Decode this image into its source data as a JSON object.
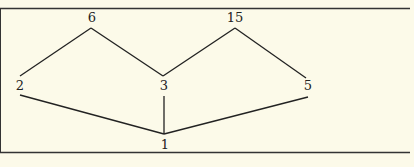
{
  "diagram": {
    "type": "hasse-diagram",
    "nodes": [
      {
        "id": "n6",
        "label": "6",
        "x": 91,
        "y": 21
      },
      {
        "id": "n15",
        "label": "15",
        "x": 235,
        "y": 21
      },
      {
        "id": "n2",
        "label": "2",
        "x": 20,
        "y": 88
      },
      {
        "id": "n3",
        "label": "3",
        "x": 164,
        "y": 88
      },
      {
        "id": "n5",
        "label": "5",
        "x": 307,
        "y": 88
      },
      {
        "id": "n1",
        "label": "1",
        "x": 165,
        "y": 153
      }
    ],
    "edges": [
      {
        "from": "2",
        "to": "6"
      },
      {
        "from": "3",
        "to": "6"
      },
      {
        "from": "3",
        "to": "15"
      },
      {
        "from": "5",
        "to": "15"
      },
      {
        "from": "1",
        "to": "2"
      },
      {
        "from": "1",
        "to": "3"
      },
      {
        "from": "1",
        "to": "5"
      }
    ]
  }
}
